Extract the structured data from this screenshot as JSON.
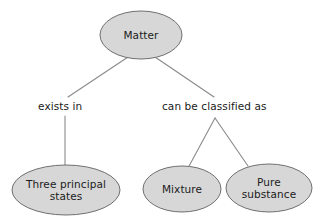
{
  "diagram": {
    "background_color": "#ffffff",
    "node_fill_color": "#d7d7d7",
    "node_stroke_color": "#6f6f6f",
    "connector_color": "#8a8a8a",
    "text_color": "#1b1b1b",
    "nodes": [
      {
        "id": "matter",
        "label": "Matter",
        "label_lines": [
          "Matter"
        ],
        "shape": "ellipse",
        "cx": 141,
        "cy": 35,
        "rx": 41,
        "ry": 24
      },
      {
        "id": "three-principal-states",
        "label": "Three principal states",
        "label_lines": [
          "Three principal",
          "states"
        ],
        "shape": "ellipse",
        "cx": 66,
        "cy": 190,
        "rx": 54,
        "ry": 25
      },
      {
        "id": "mixture",
        "label": "Mixture",
        "label_lines": [
          "Mixture"
        ],
        "shape": "ellipse",
        "cx": 182,
        "cy": 189,
        "rx": 39,
        "ry": 23
      },
      {
        "id": "pure-substance",
        "label": "Pure substance",
        "label_lines": [
          "Pure",
          "substance"
        ],
        "shape": "ellipse",
        "cx": 269,
        "cy": 188,
        "rx": 43,
        "ry": 24
      }
    ],
    "edge_labels": [
      {
        "id": "exists-in",
        "text": "exists in",
        "x": 38,
        "y": 100
      },
      {
        "id": "can-be-classified-as",
        "text": "can be classified as",
        "x": 162,
        "y": 100
      }
    ],
    "connectors": [
      {
        "id": "matter-to-exists-in",
        "from": "matter",
        "to": "exists-in",
        "points": "128,57 68,97"
      },
      {
        "id": "matter-to-can-be-classified-as",
        "from": "matter",
        "to": "can-be-classified-as",
        "points": "155,57 214,97"
      },
      {
        "id": "exists-in-to-three-principal-states",
        "from": "exists-in",
        "to": "three-principal-states",
        "points": "65,116 65,166"
      },
      {
        "id": "classified-to-mixture",
        "from": "can-be-classified-as",
        "to": "mixture",
        "points": "215,118 188,168"
      },
      {
        "id": "classified-to-pure-substance",
        "from": "can-be-classified-as",
        "to": "pure-substance",
        "points": "215,118 248,166"
      }
    ]
  }
}
